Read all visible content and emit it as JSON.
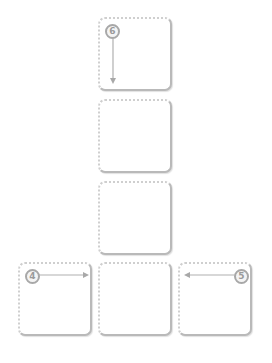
{
  "diagram": {
    "layout": "inverted-T grid of slots",
    "slots": [
      {
        "id": "top",
        "row": 0,
        "col": 1
      },
      {
        "id": "mid-upper",
        "row": 1,
        "col": 1
      },
      {
        "id": "mid-lower",
        "row": 2,
        "col": 1
      },
      {
        "id": "bottom-left",
        "row": 3,
        "col": 0
      },
      {
        "id": "bottom-center",
        "row": 3,
        "col": 1
      },
      {
        "id": "bottom-right",
        "row": 3,
        "col": 2
      }
    ],
    "badges": [
      {
        "slot": "top",
        "label": "6",
        "arrow": "down"
      },
      {
        "slot": "bottom-left",
        "label": "4",
        "arrow": "right"
      },
      {
        "slot": "bottom-right",
        "label": "5",
        "arrow": "left"
      }
    ],
    "colors": {
      "border": "#b9b9b9",
      "dotted_border": "#cfcfcf",
      "badge_ring": "#a8a8a8",
      "badge_text": "#9a9a9a",
      "arrow": "#b0b0b0"
    }
  }
}
